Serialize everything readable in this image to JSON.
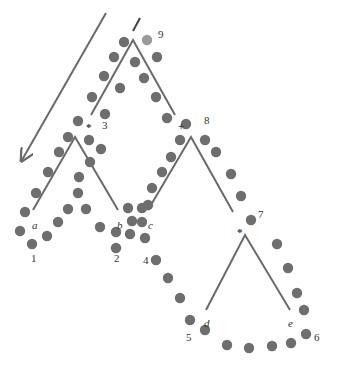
{
  "diagram": {
    "line_color": "#6a6a6a",
    "dot_color": "#6e6e6e",
    "light_dot_color": "#9a9a9a",
    "arrow": {
      "x1": 106,
      "y1": 13,
      "x2": 22,
      "y2": 160
    },
    "tick": {
      "x1": 133,
      "y1": 31,
      "x2": 140,
      "y2": 18
    },
    "tents": [
      {
        "name": "tent-top",
        "points": "91,115 133,40 175,115"
      },
      {
        "name": "tent-ab",
        "points": "33,210 75,137 118,210"
      },
      {
        "name": "tent-c8",
        "points": "148,210 191,137 233,212"
      },
      {
        "name": "tent-de",
        "points": "206,310 245,235 290,310"
      }
    ],
    "letters": [
      {
        "id": "a",
        "text": "a",
        "x": 32,
        "y": 229
      },
      {
        "id": "b",
        "text": "b",
        "x": 117,
        "y": 229
      },
      {
        "id": "c",
        "text": "c",
        "x": 148,
        "y": 229
      },
      {
        "id": "d",
        "text": "d",
        "x": 204,
        "y": 327
      },
      {
        "id": "e",
        "text": "e",
        "x": 288,
        "y": 327
      }
    ],
    "numbers": [
      {
        "id": "1",
        "text": "1",
        "x": 31,
        "y": 262
      },
      {
        "id": "2",
        "text": "2",
        "x": 114,
        "y": 262
      },
      {
        "id": "3",
        "text": "3",
        "x": 102,
        "y": 129
      },
      {
        "id": "4",
        "text": "4",
        "x": 143,
        "y": 264
      },
      {
        "id": "5",
        "text": "5",
        "x": 186,
        "y": 341
      },
      {
        "id": "6",
        "text": "6",
        "x": 314,
        "y": 341
      },
      {
        "id": "7",
        "text": "7",
        "x": 258,
        "y": 218
      },
      {
        "id": "8",
        "text": "8",
        "x": 204,
        "y": 124
      },
      {
        "id": "9",
        "text": "9",
        "x": 158,
        "y": 38
      }
    ],
    "markers": [
      {
        "id": "star-3",
        "text": "*",
        "x": 86,
        "y": 131
      },
      {
        "id": "plus-8",
        "text": "+",
        "x": 178,
        "y": 130
      },
      {
        "id": "star-7",
        "text": "*",
        "x": 237,
        "y": 236
      }
    ],
    "dots": [
      [
        124,
        42
      ],
      [
        147,
        40
      ],
      [
        114,
        57
      ],
      [
        157,
        57
      ],
      [
        104,
        76
      ],
      [
        135,
        62
      ],
      [
        92,
        97
      ],
      [
        144,
        78
      ],
      [
        78,
        121
      ],
      [
        120,
        88
      ],
      [
        105,
        114
      ],
      [
        156,
        97
      ],
      [
        167,
        118
      ],
      [
        89,
        140
      ],
      [
        68,
        137
      ],
      [
        101,
        149
      ],
      [
        59,
        152
      ],
      [
        90,
        162
      ],
      [
        48,
        172
      ],
      [
        79,
        177
      ],
      [
        36,
        193
      ],
      [
        78,
        193
      ],
      [
        68,
        209
      ],
      [
        25,
        212
      ],
      [
        86,
        209
      ],
      [
        20,
        231
      ],
      [
        58,
        222
      ],
      [
        47,
        236
      ],
      [
        32,
        244
      ],
      [
        100,
        227
      ],
      [
        116,
        232
      ],
      [
        128,
        208
      ],
      [
        142,
        208
      ],
      [
        132,
        221
      ],
      [
        142,
        222
      ],
      [
        130,
        234
      ],
      [
        145,
        238
      ],
      [
        116,
        248
      ],
      [
        156,
        260
      ],
      [
        168,
        278
      ],
      [
        180,
        298
      ],
      [
        190,
        320
      ],
      [
        205,
        330
      ],
      [
        227,
        345
      ],
      [
        249,
        348
      ],
      [
        272,
        346
      ],
      [
        291,
        343
      ],
      [
        306,
        334
      ],
      [
        304,
        310
      ],
      [
        297,
        293
      ],
      [
        288,
        268
      ],
      [
        277,
        244
      ],
      [
        251,
        220
      ],
      [
        241,
        196
      ],
      [
        231,
        174
      ],
      [
        216,
        152
      ],
      [
        205,
        140
      ],
      [
        186,
        124
      ],
      [
        180,
        140
      ],
      [
        171,
        157
      ],
      [
        162,
        172
      ],
      [
        152,
        188
      ],
      [
        148,
        205
      ]
    ],
    "light_dots": [
      [
        147,
        40
      ]
    ]
  }
}
